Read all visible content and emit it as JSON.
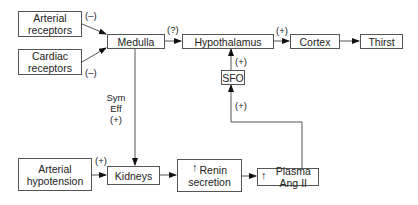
{
  "nodes": {
    "arterial_receptors": {
      "line1": "Arterial",
      "line2": "receptors"
    },
    "cardiac_receptors": {
      "line1": "Cardiac",
      "line2": "receptors"
    },
    "medulla": {
      "label": "Medulla"
    },
    "hypothalamus": {
      "label": "Hypothalamus"
    },
    "cortex": {
      "label": "Cortex"
    },
    "thirst": {
      "label": "Thirst"
    },
    "sfo": {
      "label": "SFO"
    },
    "arterial_hypotension": {
      "line1": "Arterial",
      "line2": "hypotension"
    },
    "kidneys": {
      "label": "Kidneys"
    },
    "renin_secretion": {
      "arrow": "↑",
      "line1": "Renin",
      "line2": "secretion"
    },
    "plasma_ang_ii": {
      "arrow": "↑",
      "label": "Plasma Ang II"
    }
  },
  "edge_labels": {
    "arterial_to_medulla": "(–)",
    "cardiac_to_medulla": "(–)",
    "medulla_to_hypothalamus": "(?)",
    "hypothalamus_to_cortex": "(+)",
    "sfo_to_hypothalamus": "(+)",
    "angii_to_sfo": "(+)",
    "medulla_to_kidneys": {
      "line1": "Sym",
      "line2": "Eff",
      "line3": "(+)"
    },
    "hypotension_to_kidneys": "(+)"
  },
  "colors": {
    "line": "#555555",
    "arrow": "#111111"
  }
}
